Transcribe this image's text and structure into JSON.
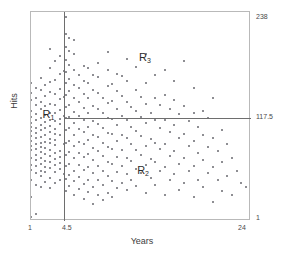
{
  "chart_data": {
    "type": "scatter",
    "title": "",
    "xlabel": "Years",
    "ylabel": "Hits",
    "xlim": [
      1,
      24
    ],
    "ylim": [
      1,
      238
    ],
    "grid": false,
    "legend": "none",
    "x_ticks": [
      "1",
      "4.5",
      "24"
    ],
    "x_tick_values": [
      1,
      4.5,
      24
    ],
    "y_ticks": [
      "238",
      "117.5",
      "1"
    ],
    "y_tick_values": [
      238,
      117.5,
      1
    ],
    "y_ticks_position": "right",
    "point_color": "#8e8e93",
    "line_color": "#6e6e6e",
    "splits": [
      {
        "name": "Years = 4.5",
        "orientation": "vertical",
        "value": 4.5
      },
      {
        "name": "Hits = 117.5",
        "orientation": "horizontal",
        "value": 117.5,
        "x_from": 4.5,
        "x_to": 24
      }
    ],
    "annotations": [
      {
        "id": "R1",
        "label": "R",
        "subscript": "1",
        "x": 2.3,
        "y": 120
      },
      {
        "id": "R2",
        "label": "R",
        "subscript": "2",
        "x": 12.2,
        "y": 56
      },
      {
        "id": "R3",
        "label": "R",
        "subscript": "3",
        "x": 12.4,
        "y": 185
      }
    ],
    "points": [
      [
        1,
        5
      ],
      [
        1,
        28
      ],
      [
        1,
        47
      ],
      [
        1,
        59
      ],
      [
        1,
        64
      ],
      [
        1,
        72
      ],
      [
        1,
        81
      ],
      [
        1,
        86
      ],
      [
        1,
        92
      ],
      [
        1,
        97
      ],
      [
        1,
        103
      ],
      [
        1,
        108
      ],
      [
        1,
        112
      ],
      [
        1,
        119
      ],
      [
        1,
        126
      ],
      [
        1,
        138
      ],
      [
        1,
        146
      ],
      [
        1,
        158
      ],
      [
        1.5,
        9
      ],
      [
        1.5,
        42
      ],
      [
        1.5,
        55
      ],
      [
        1.5,
        63
      ],
      [
        1.5,
        70
      ],
      [
        1.5,
        76
      ],
      [
        1.5,
        83
      ],
      [
        1.5,
        88
      ],
      [
        1.5,
        95
      ],
      [
        1.5,
        101
      ],
      [
        1.5,
        107
      ],
      [
        1.5,
        115
      ],
      [
        1.5,
        122
      ],
      [
        1.5,
        132
      ],
      [
        1.5,
        141
      ],
      [
        1.5,
        152
      ],
      [
        2,
        40
      ],
      [
        2,
        52
      ],
      [
        2,
        58
      ],
      [
        2,
        66
      ],
      [
        2,
        73
      ],
      [
        2,
        79
      ],
      [
        2,
        85
      ],
      [
        2,
        90
      ],
      [
        2,
        96
      ],
      [
        2,
        104
      ],
      [
        2,
        110
      ],
      [
        2,
        118
      ],
      [
        2,
        128
      ],
      [
        2,
        136
      ],
      [
        2,
        149
      ],
      [
        2,
        163
      ],
      [
        2.5,
        45
      ],
      [
        2.5,
        56
      ],
      [
        2.5,
        62
      ],
      [
        2.5,
        69
      ],
      [
        2.5,
        77
      ],
      [
        2.5,
        84
      ],
      [
        2.5,
        91
      ],
      [
        2.5,
        99
      ],
      [
        2.5,
        106
      ],
      [
        2.5,
        113
      ],
      [
        2.5,
        121
      ],
      [
        2.5,
        131
      ],
      [
        2.5,
        143
      ],
      [
        2.5,
        155
      ],
      [
        3,
        38
      ],
      [
        3,
        50
      ],
      [
        3,
        61
      ],
      [
        3,
        68
      ],
      [
        3,
        75
      ],
      [
        3,
        82
      ],
      [
        3,
        89
      ],
      [
        3,
        94
      ],
      [
        3,
        102
      ],
      [
        3,
        109
      ],
      [
        3,
        116
      ],
      [
        3,
        124
      ],
      [
        3,
        134
      ],
      [
        3,
        147
      ],
      [
        3,
        159
      ],
      [
        3,
        174
      ],
      [
        3,
        196
      ],
      [
        3.5,
        44
      ],
      [
        3.5,
        57
      ],
      [
        3.5,
        65
      ],
      [
        3.5,
        71
      ],
      [
        3.5,
        78
      ],
      [
        3.5,
        87
      ],
      [
        3.5,
        93
      ],
      [
        3.5,
        100
      ],
      [
        3.5,
        105
      ],
      [
        3.5,
        114
      ],
      [
        3.5,
        123
      ],
      [
        3.5,
        133
      ],
      [
        3.5,
        145
      ],
      [
        3.5,
        161
      ],
      [
        3.5,
        182
      ],
      [
        4,
        48
      ],
      [
        4,
        60
      ],
      [
        4,
        67
      ],
      [
        4,
        74
      ],
      [
        4,
        80
      ],
      [
        4,
        98
      ],
      [
        4,
        111
      ],
      [
        4,
        117
      ],
      [
        4,
        127
      ],
      [
        4,
        139
      ],
      [
        4,
        151
      ],
      [
        4,
        168
      ],
      [
        4,
        188
      ],
      [
        4.4,
        54
      ],
      [
        4.4,
        88
      ],
      [
        4.4,
        120
      ],
      [
        4.4,
        142
      ],
      [
        4.4,
        171
      ],
      [
        4.7,
        35
      ],
      [
        4.7,
        49
      ],
      [
        4.7,
        63
      ],
      [
        4.7,
        76
      ],
      [
        4.7,
        90
      ],
      [
        4.7,
        104
      ],
      [
        4.7,
        118
      ],
      [
        4.7,
        130
      ],
      [
        4.7,
        144
      ],
      [
        4.7,
        157
      ],
      [
        4.7,
        170
      ],
      [
        4.7,
        184
      ],
      [
        4.7,
        198
      ],
      [
        4.7,
        213
      ],
      [
        4.7,
        232
      ],
      [
        5,
        41
      ],
      [
        5,
        53
      ],
      [
        5,
        66
      ],
      [
        5,
        79
      ],
      [
        5,
        92
      ],
      [
        5,
        106
      ],
      [
        5,
        119
      ],
      [
        5,
        132
      ],
      [
        5,
        148
      ],
      [
        5,
        162
      ],
      [
        5,
        178
      ],
      [
        5,
        194
      ],
      [
        5,
        209
      ],
      [
        5.5,
        31
      ],
      [
        5.5,
        46
      ],
      [
        5.5,
        58
      ],
      [
        5.5,
        72
      ],
      [
        5.5,
        86
      ],
      [
        5.5,
        99
      ],
      [
        5.5,
        112
      ],
      [
        5.5,
        125
      ],
      [
        5.5,
        140
      ],
      [
        5.5,
        155
      ],
      [
        5.5,
        172
      ],
      [
        5.5,
        190
      ],
      [
        5.5,
        206
      ],
      [
        6,
        37
      ],
      [
        6,
        51
      ],
      [
        6,
        64
      ],
      [
        6,
        78
      ],
      [
        6,
        91
      ],
      [
        6,
        105
      ],
      [
        6,
        120
      ],
      [
        6,
        136
      ],
      [
        6,
        152
      ],
      [
        6,
        167
      ],
      [
        6.5,
        26
      ],
      [
        6.5,
        43
      ],
      [
        6.5,
        59
      ],
      [
        6.5,
        74
      ],
      [
        6.5,
        88
      ],
      [
        6.5,
        102
      ],
      [
        6.5,
        116
      ],
      [
        6.5,
        129
      ],
      [
        6.5,
        145
      ],
      [
        6.5,
        160
      ],
      [
        6.5,
        177
      ],
      [
        7,
        34
      ],
      [
        7,
        48
      ],
      [
        7,
        62
      ],
      [
        7,
        77
      ],
      [
        7,
        93
      ],
      [
        7,
        108
      ],
      [
        7,
        123
      ],
      [
        7,
        141
      ],
      [
        7,
        158
      ],
      [
        7,
        175
      ],
      [
        7.5,
        20
      ],
      [
        7.5,
        39
      ],
      [
        7.5,
        55
      ],
      [
        7.5,
        70
      ],
      [
        7.5,
        84
      ],
      [
        7.5,
        98
      ],
      [
        7.5,
        114
      ],
      [
        7.5,
        131
      ],
      [
        7.5,
        150
      ],
      [
        7.5,
        166
      ],
      [
        8,
        30
      ],
      [
        8,
        47
      ],
      [
        8,
        63
      ],
      [
        8,
        80
      ],
      [
        8,
        96
      ],
      [
        8,
        111
      ],
      [
        8,
        128
      ],
      [
        8,
        146
      ],
      [
        8,
        164
      ],
      [
        8,
        180
      ],
      [
        8.5,
        25
      ],
      [
        8.5,
        42
      ],
      [
        8.5,
        58
      ],
      [
        8.5,
        75
      ],
      [
        8.5,
        90
      ],
      [
        8.5,
        107
      ],
      [
        8.5,
        124
      ],
      [
        8.5,
        140
      ],
      [
        9,
        33
      ],
      [
        9,
        52
      ],
      [
        9,
        68
      ],
      [
        9,
        85
      ],
      [
        9,
        101
      ],
      [
        9,
        118
      ],
      [
        9,
        135
      ],
      [
        9,
        154
      ],
      [
        9,
        172
      ],
      [
        9,
        193
      ],
      [
        9.5,
        28
      ],
      [
        9.5,
        46
      ],
      [
        9.5,
        66
      ],
      [
        9.5,
        83
      ],
      [
        9.5,
        100
      ],
      [
        9.5,
        117
      ],
      [
        9.5,
        137
      ],
      [
        9.5,
        156
      ],
      [
        10,
        38
      ],
      [
        10,
        57
      ],
      [
        10,
        74
      ],
      [
        10,
        92
      ],
      [
        10,
        110
      ],
      [
        10,
        128
      ],
      [
        10,
        148
      ],
      [
        10,
        168
      ],
      [
        10.5,
        44
      ],
      [
        10.5,
        63
      ],
      [
        10.5,
        81
      ],
      [
        10.5,
        99
      ],
      [
        10.5,
        120
      ],
      [
        10.5,
        143
      ],
      [
        10.5,
        165
      ],
      [
        11,
        36
      ],
      [
        11,
        54
      ],
      [
        11,
        73
      ],
      [
        11,
        95
      ],
      [
        11,
        115
      ],
      [
        11,
        136
      ],
      [
        11,
        160
      ],
      [
        11,
        185
      ],
      [
        11.5,
        48
      ],
      [
        11.5,
        69
      ],
      [
        11.5,
        88
      ],
      [
        11.5,
        108
      ],
      [
        11.5,
        130
      ],
      [
        12,
        41
      ],
      [
        12,
        60
      ],
      [
        12,
        82
      ],
      [
        12,
        103
      ],
      [
        12,
        126
      ],
      [
        12,
        150
      ],
      [
        12,
        176
      ],
      [
        12.5,
        55
      ],
      [
        12.5,
        76
      ],
      [
        12.5,
        97
      ],
      [
        12.5,
        119
      ],
      [
        12.5,
        142
      ],
      [
        13,
        33
      ],
      [
        13,
        64
      ],
      [
        13,
        86
      ],
      [
        13,
        112
      ],
      [
        13,
        134
      ],
      [
        13,
        158
      ],
      [
        13,
        190
      ],
      [
        13.5,
        50
      ],
      [
        13.5,
        71
      ],
      [
        13.5,
        94
      ],
      [
        13.5,
        124
      ],
      [
        14,
        42
      ],
      [
        14,
        68
      ],
      [
        14,
        90
      ],
      [
        14,
        115
      ],
      [
        14,
        140
      ],
      [
        14,
        166
      ],
      [
        14.5,
        58
      ],
      [
        14.5,
        83
      ],
      [
        14.5,
        106
      ],
      [
        14.5,
        133
      ],
      [
        15,
        30
      ],
      [
        15,
        62
      ],
      [
        15,
        88
      ],
      [
        15,
        116
      ],
      [
        15,
        144
      ],
      [
        15,
        172
      ],
      [
        15.5,
        47
      ],
      [
        15.5,
        75
      ],
      [
        15.5,
        102
      ],
      [
        15.5,
        128
      ],
      [
        16,
        54
      ],
      [
        16,
        80
      ],
      [
        16,
        110
      ],
      [
        16,
        138
      ],
      [
        16,
        160
      ],
      [
        16.5,
        36
      ],
      [
        16.5,
        66
      ],
      [
        16.5,
        95
      ],
      [
        16.5,
        122
      ],
      [
        17,
        44
      ],
      [
        17,
        72
      ],
      [
        17,
        100
      ],
      [
        17,
        131
      ],
      [
        17,
        182
      ],
      [
        17.5,
        58
      ],
      [
        17.5,
        86
      ],
      [
        17.5,
        114
      ],
      [
        18,
        28
      ],
      [
        18,
        63
      ],
      [
        18,
        92
      ],
      [
        18,
        124
      ],
      [
        18,
        152
      ],
      [
        18.5,
        48
      ],
      [
        18.5,
        78
      ],
      [
        18.5,
        108
      ],
      [
        19,
        40
      ],
      [
        19,
        70
      ],
      [
        19,
        98
      ],
      [
        19,
        126
      ],
      [
        19.5,
        55
      ],
      [
        19.5,
        85
      ],
      [
        19.5,
        118
      ],
      [
        20,
        22
      ],
      [
        20,
        62
      ],
      [
        20,
        95
      ],
      [
        20,
        140
      ],
      [
        20.5,
        48
      ],
      [
        20.5,
        80
      ],
      [
        21,
        35
      ],
      [
        21,
        68
      ],
      [
        21,
        104
      ],
      [
        21.5,
        52
      ],
      [
        21.5,
        88
      ],
      [
        22,
        30
      ],
      [
        22,
        72
      ],
      [
        22.5,
        58
      ],
      [
        23,
        44
      ],
      [
        23.5,
        40
      ]
    ]
  }
}
